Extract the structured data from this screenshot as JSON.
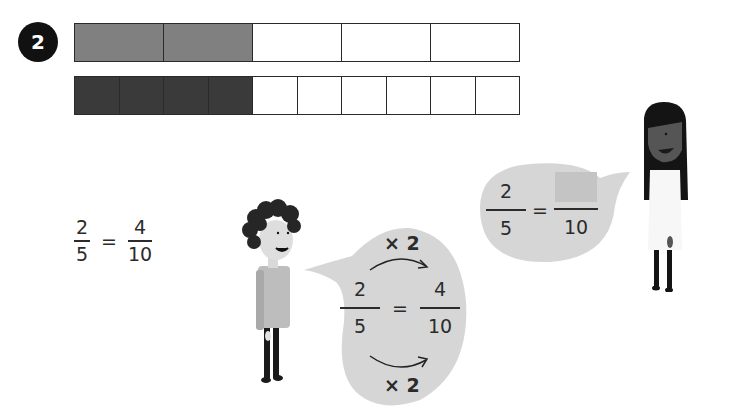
{
  "question": {
    "number": "2"
  },
  "bars": {
    "top": {
      "parts": 5,
      "shaded": 2,
      "shade_color": "#808080"
    },
    "bottom": {
      "parts": 10,
      "shaded": 4,
      "shade_color": "#3a3a3a"
    }
  },
  "equation": {
    "left_num": "2",
    "left_den": "5",
    "eq": "=",
    "right_num": "4",
    "right_den": "10"
  },
  "boy_bubble": {
    "top_label": "× 2",
    "left_num": "2",
    "left_den": "5",
    "eq": "=",
    "right_num": "4",
    "right_den": "10",
    "bottom_label": "× 2"
  },
  "girl_bubble": {
    "left_num": "2",
    "left_den": "5",
    "eq": "=",
    "right_num": "",
    "right_den": "10"
  },
  "colors": {
    "bubble": "#d6d6d6",
    "blank_box": "#c4c4c4",
    "badge": "#111111"
  }
}
